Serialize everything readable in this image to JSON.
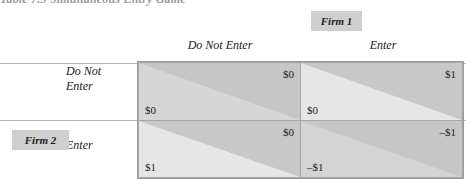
{
  "title": "Table 7.3  Simultaneous Entry Game",
  "firm1_label": "Firm 1",
  "firm2_label": "Firm 2",
  "columns": [
    "Do Not Enter",
    "Enter"
  ],
  "rows": [
    {
      "label_line1": "Do Not",
      "label_line2": "Enter"
    },
    {
      "label_line1": "Enter",
      "label_line2": ""
    }
  ],
  "cells": [
    [
      {
        "firm1": "$0",
        "firm2": "$0"
      },
      {
        "firm1": "$1",
        "firm2": "$0"
      }
    ],
    [
      {
        "firm1": "$0",
        "firm2": "$1"
      },
      {
        "firm1": "–$1",
        "firm2": "–$1"
      }
    ]
  ],
  "colors": {
    "dark_shade": "#c4c4c4",
    "light_shade": "#e3e3e3",
    "mid_shade": "#d2d2d2",
    "label_bg": "#cfcfcf"
  }
}
